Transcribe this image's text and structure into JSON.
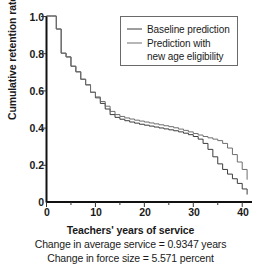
{
  "chart_data": {
    "type": "line",
    "title": "",
    "xlabel": "Teachers' years of service",
    "ylabel": "Cumulative retention rate",
    "xlim": [
      0,
      42
    ],
    "ylim": [
      0,
      1.0
    ],
    "grid": false,
    "step": "post",
    "legend_position": "upper-right",
    "x_ticks": [
      "0",
      "10",
      "20",
      "30",
      "40"
    ],
    "x_tick_values": [
      0,
      10,
      20,
      30,
      40
    ],
    "x_minor_tick_values": [
      5,
      15,
      25,
      35
    ],
    "y_ticks": [
      "0",
      "0.2",
      "0.4",
      "0.6",
      "0.8",
      "1.0"
    ],
    "y_tick_values": [
      0,
      0.2,
      0.4,
      0.6,
      0.8,
      1.0
    ],
    "x": [
      0,
      1,
      2,
      3,
      4,
      5,
      6,
      7,
      8,
      9,
      10,
      11,
      12,
      13,
      14,
      15,
      16,
      17,
      18,
      19,
      20,
      21,
      22,
      23,
      24,
      25,
      26,
      27,
      28,
      29,
      30,
      31,
      32,
      33,
      34,
      35,
      36,
      37,
      38,
      39,
      40,
      41
    ],
    "series": [
      {
        "name": "Baseline prediction",
        "color": "#3c3c3c",
        "values": [
          1.0,
          1.0,
          0.93,
          0.8,
          0.78,
          0.73,
          0.7,
          0.66,
          0.63,
          0.59,
          0.56,
          0.53,
          0.5,
          0.47,
          0.455,
          0.445,
          0.437,
          0.43,
          0.424,
          0.418,
          0.413,
          0.408,
          0.403,
          0.398,
          0.393,
          0.388,
          0.383,
          0.377,
          0.37,
          0.362,
          0.352,
          0.338,
          0.315,
          0.283,
          0.243,
          0.205,
          0.175,
          0.15,
          0.125,
          0.1,
          0.07,
          0.04
        ]
      },
      {
        "name": "Prediction with new age eligibility",
        "color": "#6e6e6e",
        "values": [
          1.0,
          1.0,
          0.93,
          0.8,
          0.78,
          0.73,
          0.7,
          0.66,
          0.63,
          0.59,
          0.565,
          0.54,
          0.515,
          0.487,
          0.47,
          0.46,
          0.452,
          0.446,
          0.44,
          0.435,
          0.43,
          0.425,
          0.42,
          0.415,
          0.41,
          0.405,
          0.399,
          0.392,
          0.385,
          0.377,
          0.368,
          0.36,
          0.352,
          0.345,
          0.338,
          0.33,
          0.315,
          0.29,
          0.255,
          0.215,
          0.175,
          0.12
        ]
      }
    ],
    "legend": [
      {
        "label": "Baseline prediction",
        "label_line2": "",
        "color": "#3c3c3c"
      },
      {
        "label": "Prediction with",
        "label_line2": "new age eligibility",
        "color": "#6e6e6e"
      }
    ],
    "annotations": [
      "Change in average service = 0.9347 years",
      "Change in force size = 5.571 percent"
    ]
  },
  "caption": {
    "line1": "Change in average service = 0.9347 years",
    "line2": "Change in force size = 5.571 percent"
  }
}
